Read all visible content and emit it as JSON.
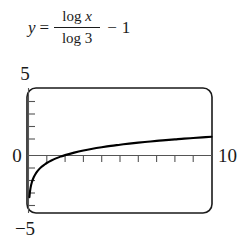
{
  "equation": {
    "lhs_variable": "y",
    "equals": "=",
    "numerator": "log x",
    "denominator": "log 3",
    "operator": "−",
    "constant": "1",
    "full_text": "y = log x / log 3 − 1"
  },
  "chart_data": {
    "type": "line",
    "title": "",
    "subtitle": "",
    "xlabel": "",
    "ylabel": "",
    "xlim": [
      0,
      10
    ],
    "ylim": [
      -5,
      5
    ],
    "grid": false,
    "legend": null,
    "frame": "rounded-rect",
    "axis_color": "#1a1a1a",
    "curve_color": "#000000",
    "background": "#ffffff",
    "x_tick_step": 1,
    "y_tick_step": 1,
    "x_tick_values": [
      1,
      2,
      3,
      4,
      5,
      6,
      7,
      8,
      9
    ],
    "y_tick_values": [
      -4,
      -3,
      -2,
      -1,
      1,
      2,
      3,
      4
    ],
    "tick_labels": {
      "y_top": "5",
      "y_zero": "0",
      "y_bottom": "−5",
      "x_right": "10"
    },
    "series": [
      {
        "name": "y = log(x)/log(3) - 1",
        "x": [
          0.05,
          0.08,
          0.12,
          0.18,
          0.25,
          0.35,
          0.5,
          0.7,
          0.9,
          1.0,
          1.25,
          1.5,
          1.75,
          2.0,
          2.5,
          3.0,
          3.5,
          4.0,
          4.5,
          5.0,
          5.5,
          6.0,
          6.5,
          7.0,
          7.5,
          8.0,
          8.5,
          9.0,
          9.5,
          10.0
        ],
        "y": [
          -3.73,
          -3.3,
          -2.93,
          -2.56,
          -2.26,
          -1.96,
          -1.63,
          -1.32,
          -1.1,
          -1.0,
          -0.8,
          -0.63,
          -0.49,
          -0.37,
          -0.17,
          0.0,
          0.14,
          0.26,
          0.37,
          0.46,
          0.55,
          0.63,
          0.7,
          0.77,
          0.83,
          0.89,
          0.95,
          1.0,
          1.05,
          1.1
        ]
      }
    ],
    "asymptote": {
      "type": "vertical",
      "x": 0
    },
    "x_intercept": 3
  }
}
